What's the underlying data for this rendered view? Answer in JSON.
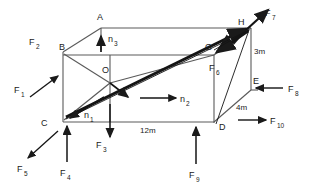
{
  "figure": {
    "background": "#ffffff",
    "stroke_color": "#555555",
    "arrow_color": "#1a1a1a",
    "text_color": "#1a1a1a"
  },
  "vertices": [
    {
      "id": "A",
      "label": "A",
      "x": 99,
      "y": 20
    },
    {
      "id": "B",
      "label": "B",
      "x": 62,
      "y": 47
    },
    {
      "id": "C",
      "label": "C",
      "x": 46,
      "y": 122
    },
    {
      "id": "D",
      "label": "D",
      "x": 226,
      "y": 123
    },
    {
      "id": "E",
      "label": "E",
      "x": 258,
      "y": 85
    },
    {
      "id": "G",
      "label": "G",
      "x": 210,
      "y": 50
    },
    {
      "id": "H",
      "label": "H",
      "x": 244,
      "y": 22
    },
    {
      "id": "O",
      "label": "O",
      "x": 104,
      "y": 76
    }
  ],
  "forces": [
    {
      "id": "F1",
      "base": "F",
      "sub": "1",
      "label_x": 18,
      "label_y": 90,
      "dir": "up-right",
      "target": "B"
    },
    {
      "id": "F2",
      "base": "F",
      "sub": "2",
      "label_x": 32,
      "label_y": 42,
      "dir": "label-only",
      "target": "B"
    },
    {
      "id": "F3",
      "base": "F",
      "sub": "3",
      "label_x": 94,
      "label_y": 143,
      "dir": "down",
      "target": "bottom-edge"
    },
    {
      "id": "F4",
      "base": "F",
      "sub": "4",
      "label_x": 63,
      "label_y": 170,
      "dir": "up",
      "target": "C"
    },
    {
      "id": "F5",
      "base": "F",
      "sub": "5",
      "label_x": 20,
      "label_y": 167,
      "dir": "down-left",
      "target": "C"
    },
    {
      "id": "F6",
      "base": "F",
      "sub": "6",
      "label_x": 213,
      "label_y": 68,
      "dir": "toward-G",
      "target": "G"
    },
    {
      "id": "F7",
      "base": "F",
      "sub": "7",
      "label_x": 265,
      "label_y": 14,
      "dir": "up-right",
      "target": "H"
    },
    {
      "id": "F8",
      "base": "F",
      "sub": "8",
      "label_x": 288,
      "label_y": 92,
      "dir": "left",
      "target": "E"
    },
    {
      "id": "F9",
      "base": "F",
      "sub": "9",
      "label_x": 192,
      "label_y": 172,
      "dir": "up",
      "target": "D"
    },
    {
      "id": "F10",
      "base": "F",
      "sub": "10",
      "label_x": 272,
      "label_y": 124,
      "dir": "right",
      "target": "D"
    }
  ],
  "normals": [
    {
      "id": "n1",
      "base": "n",
      "sub": "1",
      "label_x": 86,
      "label_y": 115,
      "dir": "down-left"
    },
    {
      "id": "n2",
      "base": "n",
      "sub": "2",
      "label_x": 180,
      "label_y": 102,
      "dir": "right"
    },
    {
      "id": "n3",
      "base": "n",
      "sub": "3",
      "label_x": 110,
      "label_y": 40,
      "dir": "up"
    }
  ],
  "dimensions": [
    {
      "id": "width",
      "text": "12m",
      "x": 149,
      "y": 130
    },
    {
      "id": "height",
      "text": "3m",
      "x": 255,
      "y": 52
    },
    {
      "id": "depth",
      "text": "4m",
      "x": 240,
      "y": 108
    }
  ]
}
